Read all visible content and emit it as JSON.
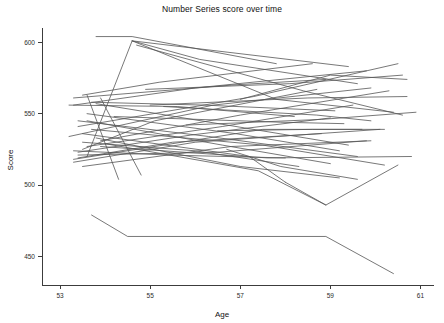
{
  "chart_data": {
    "type": "line",
    "title": "Number Series score over time",
    "subtitle": "",
    "xlabel": "Age",
    "ylabel": "Score",
    "xlim": [
      52.6,
      61.3
    ],
    "ylim": [
      430,
      610
    ],
    "xticks": [
      53,
      55,
      57,
      59,
      61
    ],
    "yticks": [
      450,
      500,
      550,
      600
    ],
    "xtick_labels": [
      "53",
      "55",
      "57",
      "59",
      "61"
    ],
    "ytick_labels": [
      "450",
      "500",
      "550",
      "600"
    ],
    "grid": false,
    "legend": "none",
    "line_color": "#555555",
    "axis_color": "#3c3c3c",
    "background_color": "#ffffff",
    "n_series": 44,
    "series": [
      {
        "name": "s1",
        "x": [
          53.8,
          54.6,
          57.8
        ],
        "y": [
          604,
          604,
          585
        ]
      },
      {
        "name": "s2",
        "x": [
          53.6,
          54.6,
          59.4
        ],
        "y": [
          520,
          601,
          583
        ]
      },
      {
        "name": "s3",
        "x": [
          54.6,
          56.1,
          59.6
        ],
        "y": [
          601,
          588,
          571
        ]
      },
      {
        "name": "s4",
        "x": [
          53.5,
          55.2,
          58.6
        ],
        "y": [
          563,
          572,
          585
        ]
      },
      {
        "name": "s5",
        "x": [
          53.3,
          56.8,
          58.9
        ],
        "y": [
          561,
          570,
          574
        ]
      },
      {
        "name": "s6",
        "x": [
          53.3,
          56.0,
          59.8
        ],
        "y": [
          556,
          568,
          580
        ]
      },
      {
        "name": "s7",
        "x": [
          53.4,
          57.3,
          60.5
        ],
        "y": [
          541,
          562,
          585
        ]
      },
      {
        "name": "s8",
        "x": [
          53.2,
          56.4,
          59.9
        ],
        "y": [
          534,
          556,
          568
        ]
      },
      {
        "name": "s9",
        "x": [
          53.9,
          57.0,
          60.3
        ],
        "y": [
          531,
          549,
          566
        ]
      },
      {
        "name": "s10",
        "x": [
          53.7,
          56.2,
          59.1
        ],
        "y": [
          558,
          556,
          552
        ]
      },
      {
        "name": "s11",
        "x": [
          53.2,
          55.6,
          58.2
        ],
        "y": [
          556,
          555,
          548
        ]
      },
      {
        "name": "s12",
        "x": [
          53.5,
          55.1,
          58.7
        ],
        "y": [
          525,
          545,
          567
        ]
      },
      {
        "name": "s13",
        "x": [
          53.6,
          56.6,
          59.5
        ],
        "y": [
          527,
          541,
          556
        ]
      },
      {
        "name": "s14",
        "x": [
          53.4,
          55.9,
          59.0
        ],
        "y": [
          523,
          535,
          547
        ]
      },
      {
        "name": "s15",
        "x": [
          53.6,
          54.3
        ],
        "y": [
          563,
          504
        ]
      },
      {
        "name": "s16",
        "x": [
          53.9,
          54.8
        ],
        "y": [
          561,
          507
        ]
      },
      {
        "name": "s17",
        "x": [
          53.3,
          57.5,
          59.7
        ],
        "y": [
          518,
          539,
          539
        ]
      },
      {
        "name": "s18",
        "x": [
          53.3,
          56.0,
          60.1
        ],
        "y": [
          516,
          530,
          539
        ]
      },
      {
        "name": "s19",
        "x": [
          53.5,
          56.8,
          59.9
        ],
        "y": [
          513,
          527,
          531
        ]
      },
      {
        "name": "s20",
        "x": [
          54.6,
          57.8,
          60.4
        ],
        "y": [
          601,
          560,
          551
        ]
      },
      {
        "name": "s21",
        "x": [
          54.7,
          58.4,
          60.6
        ],
        "y": [
          598,
          566,
          549
        ]
      },
      {
        "name": "s22",
        "x": [
          53.8,
          57.1,
          59.4
        ],
        "y": [
          557,
          540,
          528
        ]
      },
      {
        "name": "s23",
        "x": [
          53.6,
          56.9,
          59.2
        ],
        "y": [
          550,
          536,
          524
        ]
      },
      {
        "name": "s24",
        "x": [
          53.4,
          56.3,
          59.6
        ],
        "y": [
          545,
          534,
          520
        ]
      },
      {
        "name": "s25",
        "x": [
          53.7,
          57.5,
          60.2
        ],
        "y": [
          539,
          528,
          514
        ]
      },
      {
        "name": "s26",
        "x": [
          53.5,
          56.0,
          58.3
        ],
        "y": [
          530,
          524,
          513
        ]
      },
      {
        "name": "s27",
        "x": [
          53.9,
          57.6,
          60.8
        ],
        "y": [
          527,
          519,
          520
        ]
      },
      {
        "name": "s28",
        "x": [
          53.3,
          55.4,
          58.0
        ],
        "y": [
          524,
          521,
          519
        ]
      },
      {
        "name": "s29",
        "x": [
          53.4,
          56.5,
          59.8
        ],
        "y": [
          521,
          523,
          531
        ]
      },
      {
        "name": "s30",
        "x": [
          55.0,
          58.5,
          60.7
        ],
        "y": [
          556,
          561,
          562
        ]
      },
      {
        "name": "s31",
        "x": [
          54.2,
          57.9,
          59.3
        ],
        "y": [
          548,
          544,
          543
        ]
      },
      {
        "name": "s32",
        "x": [
          55.8,
          58.8,
          60.9
        ],
        "y": [
          542,
          546,
          551
        ]
      },
      {
        "name": "s33",
        "x": [
          53.5,
          57.2,
          58.0
        ],
        "y": [
          536,
          520,
          502
        ]
      },
      {
        "name": "s34",
        "x": [
          53.8,
          57.0,
          59.2
        ],
        "y": [
          533,
          513,
          505
        ]
      },
      {
        "name": "s35",
        "x": [
          54.0,
          57.4,
          58.9
        ],
        "y": [
          529,
          510,
          486
        ]
      },
      {
        "name": "s36",
        "x": [
          53.6,
          56.6,
          59.0
        ],
        "y": [
          545,
          528,
          515
        ]
      },
      {
        "name": "s37",
        "x": [
          58.0,
          58.9,
          60.5
        ],
        "y": [
          502,
          486,
          514
        ]
      },
      {
        "name": "s38",
        "x": [
          56.7,
          57.9,
          59.6
        ],
        "y": [
          525,
          513,
          504
        ]
      },
      {
        "name": "s39",
        "x": [
          53.7,
          54.5,
          58.9,
          60.4
        ],
        "y": [
          479,
          464,
          464,
          438
        ]
      },
      {
        "name": "s40",
        "x": [
          56.5,
          58.6,
          60.2
        ],
        "y": [
          538,
          539,
          539
        ]
      },
      {
        "name": "s41",
        "x": [
          54.9,
          58.1,
          60.6
        ],
        "y": [
          567,
          571,
          577
        ]
      },
      {
        "name": "s42",
        "x": [
          55.3,
          58.7,
          59.9
        ],
        "y": [
          555,
          549,
          545
        ]
      },
      {
        "name": "s43",
        "x": [
          57.0,
          59.0,
          60.7
        ],
        "y": [
          560,
          577,
          574
        ]
      },
      {
        "name": "s44",
        "x": [
          53.4,
          55.5,
          58.8
        ],
        "y": [
          519,
          530,
          536
        ]
      }
    ]
  }
}
